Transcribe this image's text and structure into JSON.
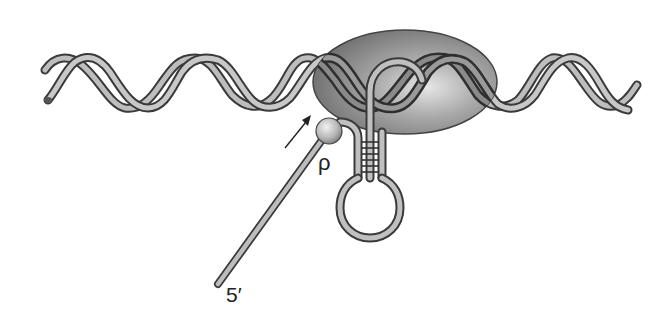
{
  "diagram": {
    "labels": {
      "rho": "ρ",
      "five_prime": "5′"
    },
    "elements": [
      {
        "name": "dna-double-helix",
        "description": "DNA double helix running horizontally across the figure"
      },
      {
        "name": "rna-polymerase",
        "description": "Grey ellipse representing RNA polymerase bound on DNA"
      },
      {
        "name": "rho-factor",
        "description": "Sphere labelled ρ bound to RNA transcript"
      },
      {
        "name": "rna-transcript",
        "description": "Single-stranded RNA extending from polymerase to the 5′ end"
      },
      {
        "name": "rna-hairpin",
        "description": "Stem-loop (hairpin) structure in the RNA below the polymerase"
      },
      {
        "name": "movement-arrow",
        "description": "Arrow indicating rho translocating toward polymerase"
      }
    ],
    "colors": {
      "strand_fill": "#b5b5b5",
      "strand_outline": "#3a3a3a",
      "polymerase_fill": "#8c8c8c",
      "polymerase_highlight": "#d0d0d0",
      "rho_fill": "#c4c4c4",
      "text": "#222222"
    }
  }
}
